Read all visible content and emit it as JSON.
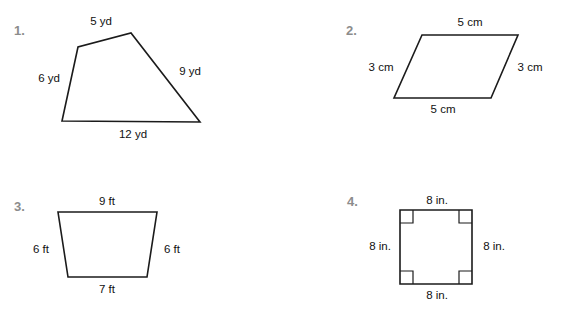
{
  "worksheet": {
    "background_color": "#ffffff",
    "line_color": "#1b1b1b",
    "number_color": "#8c8c8c",
    "text_color": "#111111"
  },
  "problems": [
    {
      "number": "1.",
      "shape": "quadrilateral",
      "labels": {
        "top": "5 yd",
        "left": "6 yd",
        "right": "9 yd",
        "bottom": "12 yd"
      },
      "unit": "yd"
    },
    {
      "number": "2.",
      "shape": "parallelogram",
      "labels": {
        "top": "5 cm",
        "left": "3 cm",
        "right": "3 cm",
        "bottom": "5 cm"
      },
      "unit": "cm"
    },
    {
      "number": "3.",
      "shape": "trapezoid",
      "labels": {
        "top": "9 ft",
        "left": "6 ft",
        "right": "6 ft",
        "bottom": "7 ft"
      },
      "unit": "ft"
    },
    {
      "number": "4.",
      "shape": "square",
      "labels": {
        "top": "8 in.",
        "left": "8 in.",
        "right": "8 in.",
        "bottom": "8 in."
      },
      "unit": "in.",
      "right_angle_marks": 4
    }
  ]
}
